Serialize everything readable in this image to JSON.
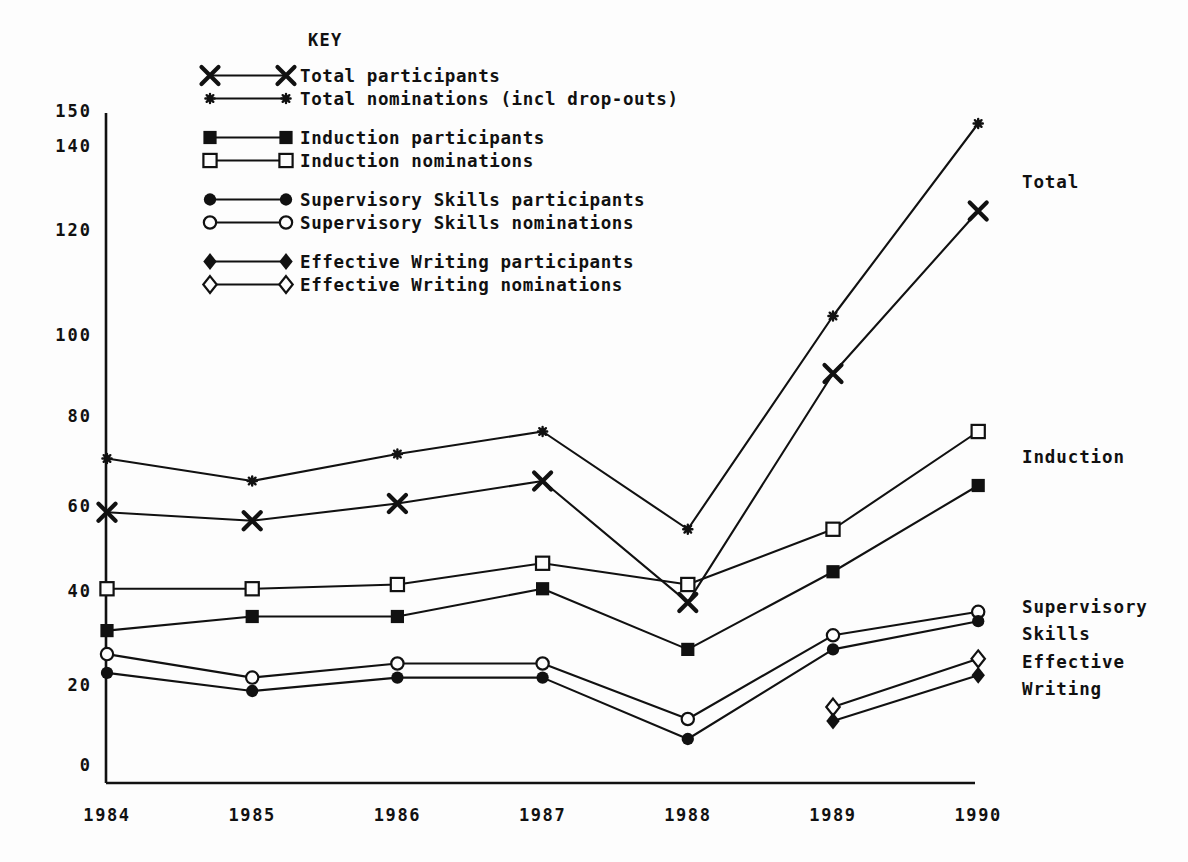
{
  "key": {
    "title": "KEY",
    "groups": [
      {
        "entries": [
          {
            "label": "Total participants",
            "marker": "cross-x-icon",
            "series": "total_participants"
          },
          {
            "label": "Total nominations (incl drop-outs)",
            "marker": "small-star-icon",
            "series": "total_nominations"
          }
        ]
      },
      {
        "entries": [
          {
            "label": "Induction participants",
            "marker": "filled-square-icon",
            "series": "induction_participants"
          },
          {
            "label": "Induction nominations",
            "marker": "open-square-icon",
            "series": "induction_nominations"
          }
        ]
      },
      {
        "entries": [
          {
            "label": "Supervisory Skills participants",
            "marker": "filled-circle-icon",
            "series": "supervisory_participants"
          },
          {
            "label": "Supervisory Skills nominations",
            "marker": "open-circle-icon",
            "series": "supervisory_nominations"
          }
        ]
      },
      {
        "entries": [
          {
            "label": "Effective Writing participants",
            "marker": "filled-diamond-icon",
            "series": "effective_writing_participants"
          },
          {
            "label": "Effective Writing nominations",
            "marker": "open-diamond-icon",
            "series": "effective_writing_nominations"
          }
        ]
      }
    ]
  },
  "annotations": [
    {
      "text": "Total",
      "x": 1022,
      "y": 172
    },
    {
      "text": "Induction",
      "x": 1022,
      "y": 447
    },
    {
      "text": "Supervisory",
      "x": 1022,
      "y": 597
    },
    {
      "text": "Skills",
      "x": 1022,
      "y": 624
    },
    {
      "text": "Effective",
      "x": 1022,
      "y": 652
    },
    {
      "text": "Writing",
      "x": 1022,
      "y": 679
    }
  ],
  "chart_data": {
    "type": "line",
    "title": "",
    "xlabel": "",
    "ylabel": "",
    "categories": [
      "1984",
      "1985",
      "1986",
      "1987",
      "1988",
      "1989",
      "1990"
    ],
    "x": [
      1984,
      1985,
      1986,
      1987,
      1988,
      1989,
      1990
    ],
    "ylim": [
      0,
      150
    ],
    "yticks": [
      0,
      20,
      40,
      60,
      80,
      100,
      120,
      140,
      150
    ],
    "grid": false,
    "legend_position": "top-left-inside",
    "series": [
      {
        "name": "Total nominations (incl drop-outs)",
        "key": "total_nominations",
        "marker": "small-star-icon",
        "values": [
          71,
          66,
          72,
          77,
          55,
          104,
          147
        ]
      },
      {
        "name": "Total participants",
        "key": "total_participants",
        "marker": "cross-x-icon",
        "values": [
          59,
          57,
          61,
          66,
          38,
          91,
          125
        ]
      },
      {
        "name": "Induction nominations",
        "key": "induction_nominations",
        "marker": "open-square-icon",
        "values": [
          41,
          41,
          42,
          47,
          42,
          55,
          77
        ]
      },
      {
        "name": "Induction participants",
        "key": "induction_participants",
        "marker": "filled-square-icon",
        "values": [
          32,
          35,
          35,
          41,
          28,
          45,
          65
        ]
      },
      {
        "name": "Supervisory Skills nominations",
        "key": "supervisory_nominations",
        "marker": "open-circle-icon",
        "values": [
          27,
          22,
          25,
          25,
          12,
          31,
          36
        ]
      },
      {
        "name": "Supervisory Skills participants",
        "key": "supervisory_participants",
        "marker": "filled-circle-icon",
        "values": [
          23,
          19,
          22,
          22,
          7,
          28,
          34
        ]
      },
      {
        "name": "Effective Writing nominations",
        "key": "effective_writing_nominations",
        "marker": "open-diamond-icon",
        "values": [
          null,
          null,
          null,
          null,
          null,
          15,
          26
        ]
      },
      {
        "name": "Effective Writing participants",
        "key": "effective_writing_participants",
        "marker": "filled-diamond-icon",
        "values": [
          null,
          null,
          null,
          null,
          null,
          11.5,
          22.5
        ]
      }
    ]
  },
  "colors": {
    "ink": "#111111",
    "background": "#fdfdfd"
  }
}
